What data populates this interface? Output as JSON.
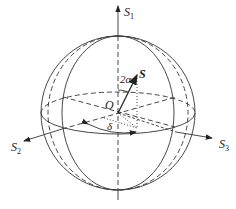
{
  "diagram": {
    "axes": {
      "s1": {
        "name": "S",
        "sub": "1"
      },
      "s2": {
        "name": "S",
        "sub": "2"
      },
      "s3": {
        "name": "S",
        "sub": "3"
      }
    },
    "labels": {
      "origin": "O",
      "vector": "S",
      "angle_alpha": "2α",
      "angle_delta": "δ"
    },
    "colors": {
      "line": "#333333",
      "background": "#ffffff"
    }
  }
}
